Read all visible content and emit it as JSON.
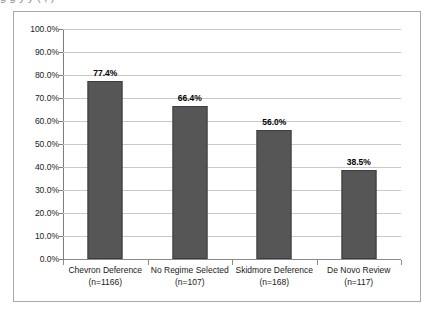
{
  "figure": {
    "clipped_caption_above": "g g y y ( , )"
  },
  "chart_data": {
    "type": "bar",
    "title": "",
    "subtitle": "",
    "xlabel": "",
    "ylabel": "",
    "categories": [
      "Chevron Deference",
      "No Regime Selected",
      "Skidmore Deference",
      "De Novo Review"
    ],
    "category_sublabels": [
      "(n=1166)",
      "(n=107)",
      "(n=168)",
      "(n=117)"
    ],
    "values": [
      77.4,
      66.4,
      56.0,
      38.5
    ],
    "value_labels": [
      "77.4%",
      "66.4%",
      "56.0%",
      "38.5%"
    ],
    "ylim": [
      0,
      100
    ],
    "ytick_values": [
      0,
      10,
      20,
      30,
      40,
      50,
      60,
      70,
      80,
      90,
      100
    ],
    "ytick_labels": [
      "0.0%",
      "10.0%",
      "20.0%",
      "30.0%",
      "40.0%",
      "50.0%",
      "60.0%",
      "70.0%",
      "80.0%",
      "90.0%",
      "100.0%"
    ],
    "grid": true,
    "grid_axis": "y",
    "legend": false,
    "legend_position": "none",
    "bar_color": "#565656",
    "bar_border_color": "#3d3d3d",
    "gridline_color": "#c9c9c9",
    "axis_color": "#7d7d7d",
    "plot_background": "#ffffff",
    "frame_border_color": "#a8a8a8"
  }
}
